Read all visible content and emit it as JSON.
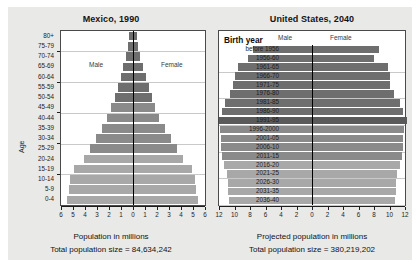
{
  "chart_data": [
    {
      "id": "mexico",
      "type": "bar",
      "orientation": "population-pyramid",
      "title": "Mexico, 1990",
      "xlabel": "Population in millions",
      "ylabel": "Age",
      "total_label": "Total population size = 84,634,242",
      "total_population": 84634242,
      "legend": {
        "left": "Male",
        "right": "Female"
      },
      "xlim": [
        -6,
        6
      ],
      "xticks": [
        6,
        5,
        4,
        3,
        2,
        1,
        0,
        1,
        2,
        3,
        4,
        5,
        6
      ],
      "grid": true,
      "category_order": "oldest-top",
      "categories": [
        "80+",
        "75-79",
        "70-74",
        "65-69",
        "60-64",
        "55-59",
        "50-54",
        "45-49",
        "40-44",
        "35-39",
        "30-34",
        "25-29",
        "20-24",
        "15-19",
        "10-14",
        "5-9",
        "0-4"
      ],
      "series": [
        {
          "name": "Male",
          "side": "left",
          "values": [
            0.35,
            0.45,
            0.6,
            0.8,
            1.0,
            1.25,
            1.5,
            1.8,
            2.15,
            2.6,
            3.1,
            3.6,
            4.1,
            4.9,
            5.25,
            5.3,
            5.5
          ]
        },
        {
          "name": "Female",
          "side": "right",
          "values": [
            0.35,
            0.45,
            0.6,
            0.85,
            1.05,
            1.3,
            1.55,
            1.85,
            2.2,
            2.65,
            3.15,
            3.65,
            4.2,
            4.95,
            5.2,
            5.25,
            5.45
          ]
        }
      ],
      "gridline_categories": [
        "75-79",
        "60-64",
        "45-49",
        "30-34",
        "15-19"
      ]
    },
    {
      "id": "united-states",
      "type": "bar",
      "orientation": "population-pyramid",
      "title": "United States, 2040",
      "xlabel": "Projected population in millions",
      "ylabel": "Birth year",
      "total_label": "Total population size = 380,219,202",
      "total_population": 380219202,
      "legend": {
        "left": "Male",
        "right": "Female"
      },
      "xlim": [
        -12,
        12
      ],
      "xticks": [
        12,
        10,
        8,
        6,
        4,
        2,
        0,
        2,
        4,
        6,
        8,
        10,
        12
      ],
      "grid": true,
      "category_order": "oldest-top",
      "categories": [
        "before 1956",
        "1956-60",
        "1961-65",
        "1966-70",
        "1971-75",
        "1976-80",
        "1981-85",
        "1986-90",
        "1991-95",
        "1996-2000",
        "2001-05",
        "2006-10",
        "2011-15",
        "2016-20",
        "2021-25",
        "2026-30",
        "2031-35",
        "2036-40"
      ],
      "series": [
        {
          "name": "Male",
          "side": "left",
          "values": [
            7.6,
            8.2,
            9.6,
            10.0,
            10.2,
            10.6,
            11.2,
            11.6,
            12.0,
            11.9,
            11.8,
            11.8,
            11.6,
            11.4,
            11.0,
            10.9,
            10.8,
            10.7
          ]
        },
        {
          "name": "Female",
          "side": "right",
          "values": [
            8.6,
            8.0,
            9.8,
            10.0,
            10.1,
            10.6,
            11.3,
            11.7,
            12.2,
            11.9,
            11.8,
            11.8,
            11.6,
            11.3,
            11.0,
            10.9,
            10.8,
            10.7
          ]
        }
      ],
      "highlight_category": "1991-95",
      "gridline_categories": [
        "1961-65",
        "1976-80",
        "1991-95",
        "2006-10",
        "2021-25",
        "2036-40"
      ]
    }
  ],
  "style": {
    "bar_dark": "#6e6e6e",
    "bar_mid": "#8a8a8a",
    "bar_light": "#a8a8a8",
    "bar_highlight": "#5a5a5a",
    "axis_color": "#000000",
    "grid_color": "#c9c9c9",
    "panel_bg": "#e9e9e7",
    "plot_bg": "#ffffff"
  }
}
